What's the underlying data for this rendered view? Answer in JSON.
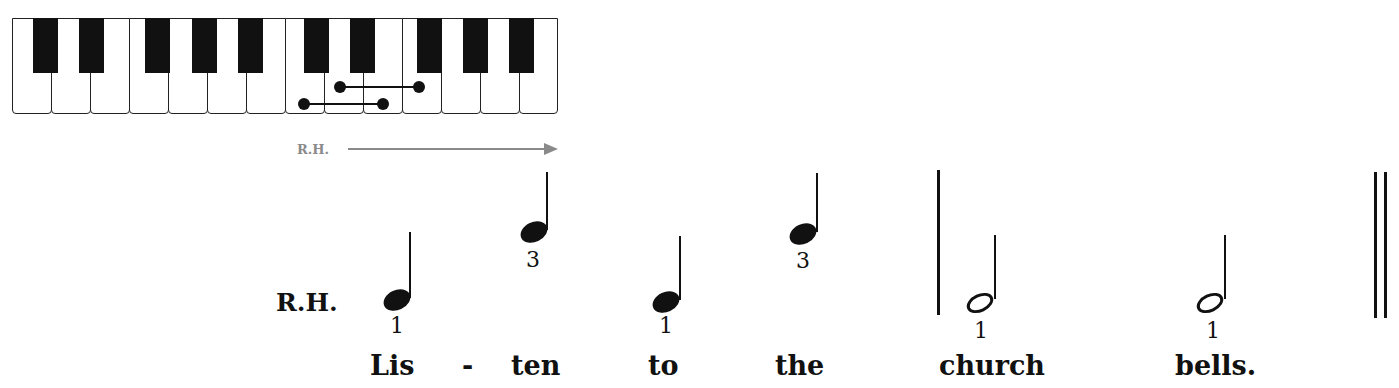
{
  "keyboard": {
    "white_keys": 14,
    "black_key_groups": [
      2,
      3,
      2,
      3
    ],
    "fingering_markers": [
      {
        "from_key": "C",
        "to_key": "E",
        "row": "lower"
      },
      {
        "from_key": "D",
        "to_key": "F",
        "row": "upper"
      }
    ]
  },
  "direction": {
    "label": "R.H.",
    "arrow": "right-arrow",
    "color": "#8a8a8a"
  },
  "staff": {
    "hand_label": "R.H.",
    "notes": [
      {
        "type": "quarter",
        "finger": "1",
        "lyric": "Lis",
        "pitch_level": "low"
      },
      {
        "type": "quarter",
        "finger": "3",
        "lyric": "-",
        "pitch_level": "high"
      },
      {
        "type": "quarter",
        "finger": "1",
        "lyric": "ten",
        "pitch_level": "low"
      },
      {
        "type": "quarter",
        "finger": "3",
        "lyric": "to",
        "pitch_level": "high"
      },
      {
        "type": "half",
        "finger": "1",
        "lyric": "the",
        "pitch_level": "low"
      },
      {
        "type": "half",
        "finger": "1",
        "lyric": "church",
        "pitch_level": "low"
      }
    ],
    "lyrics": [
      "Lis",
      "-",
      "ten",
      "to",
      "the",
      "church",
      "bells."
    ],
    "fingers": [
      "1",
      "3",
      "1",
      "3",
      "1",
      "1"
    ]
  }
}
